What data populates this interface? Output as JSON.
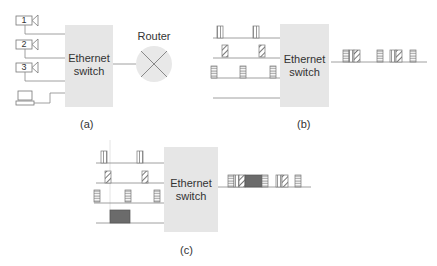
{
  "panels": {
    "a": {
      "caption": "(a)",
      "switch_label_line1": "Ethernet",
      "switch_label_line2": "switch",
      "router_label": "Router",
      "devices": [
        {
          "type": "camera",
          "label": "1"
        },
        {
          "type": "camera",
          "label": "2"
        },
        {
          "type": "camera",
          "label": "3"
        },
        {
          "type": "computer",
          "label": ""
        }
      ]
    },
    "b": {
      "caption": "(b)",
      "switch_label_line1": "Ethernet",
      "switch_label_line2": "switch",
      "input_streams": [
        "camera-1 packets (vertical)",
        "camera-2 packets (diagonal)",
        "camera-3 packets (horizontal)",
        "computer (idle)"
      ],
      "output_sequence": [
        "horizontal",
        "vertical",
        "diagonal",
        "horizontal",
        "vertical",
        "diagonal",
        "horizontal"
      ]
    },
    "c": {
      "caption": "(c)",
      "switch_label_line1": "Ethernet",
      "switch_label_line2": "switch",
      "input_streams": [
        "camera-1 packets (vertical)",
        "camera-2 packets (diagonal)",
        "camera-3 packets (horizontal)",
        "computer large packet (dark)"
      ],
      "output_sequence": [
        "horizontal",
        "vertical",
        "diagonal",
        "large-dark",
        "horizontal",
        "vertical",
        "diagonal",
        "horizontal"
      ]
    }
  },
  "colors": {
    "switch_fill": "#e6e6e6",
    "line": "#888888",
    "router_fill": "#e8e8e8",
    "dark_packet": "#6b6b6b"
  }
}
